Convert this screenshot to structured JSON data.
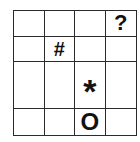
{
  "puzzle": {
    "rows": 4,
    "cols": 4,
    "cells": [
      [
        "",
        "",
        "",
        "?"
      ],
      [
        "",
        "#",
        "",
        ""
      ],
      [
        "",
        "",
        "*",
        ""
      ],
      [
        "",
        "",
        "O",
        ""
      ]
    ],
    "symbols": {
      "question": {
        "glyph": "?",
        "row": 0,
        "col": 3,
        "icon": "question-mark-icon"
      },
      "hash": {
        "glyph": "#",
        "row": 1,
        "col": 1,
        "icon": "hash-icon"
      },
      "star": {
        "glyph": "*",
        "row": 2,
        "col": 2,
        "icon": "asterisk-icon"
      },
      "circle": {
        "glyph": "O",
        "row": 3,
        "col": 2,
        "icon": "circle-o-icon"
      }
    },
    "colors": {
      "line": "#2b2b2b",
      "symbol": "#111111",
      "background": "#ffffff"
    }
  }
}
